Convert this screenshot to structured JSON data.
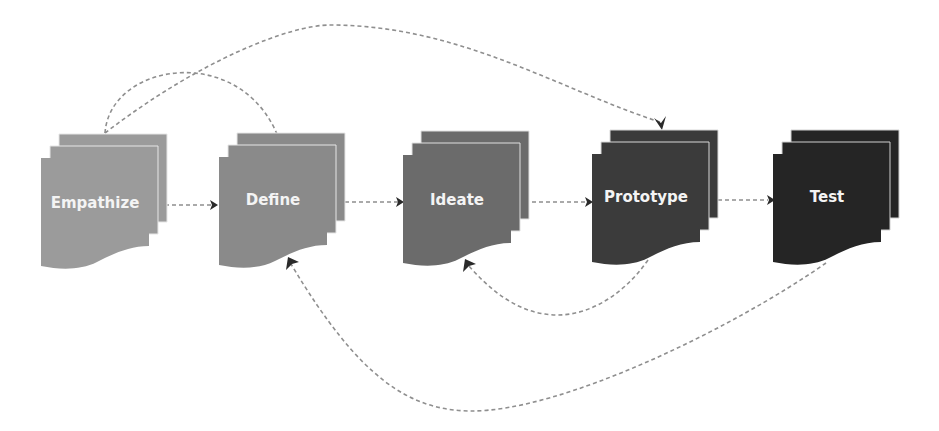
{
  "diagram": {
    "stages": [
      {
        "id": "empathize",
        "label": "Empathize",
        "color": "#9b9b9b",
        "x": 41
      },
      {
        "id": "define",
        "label": "Define",
        "color": "#8a8a8a",
        "x": 219
      },
      {
        "id": "ideate",
        "label": "Ideate",
        "color": "#6b6b6b",
        "x": 403
      },
      {
        "id": "prototype",
        "label": "Prototype",
        "color": "#3b3b3b",
        "x": 592
      },
      {
        "id": "test",
        "label": "Test",
        "color": "#252525",
        "x": 773
      }
    ],
    "connections": [
      {
        "from": "Empathize",
        "to": "Define",
        "style": "dashed",
        "type": "forward"
      },
      {
        "from": "Define",
        "to": "Ideate",
        "style": "dashed",
        "type": "forward"
      },
      {
        "from": "Ideate",
        "to": "Prototype",
        "style": "dashed",
        "type": "forward"
      },
      {
        "from": "Prototype",
        "to": "Test",
        "style": "dashed",
        "type": "forward"
      },
      {
        "from": "Empathize",
        "to": "Define",
        "style": "dashed",
        "type": "arc-over"
      },
      {
        "from": "Empathize",
        "to": "Prototype",
        "style": "dashed",
        "type": "arc-over"
      },
      {
        "from": "Prototype",
        "to": "Ideate",
        "style": "dashed",
        "type": "loop-back-under"
      },
      {
        "from": "Test",
        "to": "Define",
        "style": "dashed",
        "type": "loop-back-under"
      }
    ],
    "line_color": "#8f8f8f",
    "arrowhead_color": "#2a2a2a"
  }
}
